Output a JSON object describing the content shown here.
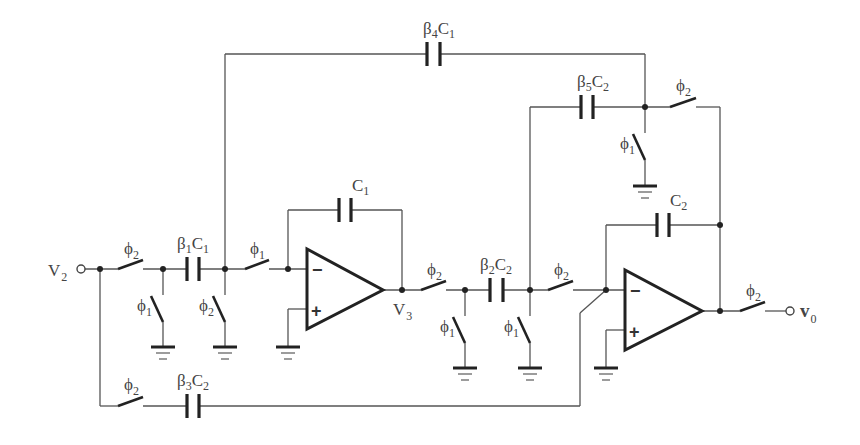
{
  "diagram": {
    "type": "switched-capacitor biquad circuit",
    "nodes": {
      "input": {
        "label": "V",
        "sub": "2"
      },
      "intermediate": {
        "label": "V",
        "sub": "3"
      },
      "output": {
        "label": "v",
        "sub": "0"
      }
    },
    "capacitors": {
      "b1c1": {
        "pre": "β",
        "psub": "1",
        "mid": "C",
        "csub": "1"
      },
      "b2c2": {
        "pre": "β",
        "psub": "2",
        "mid": "C",
        "csub": "2"
      },
      "b3c2": {
        "pre": "β",
        "psub": "3",
        "mid": "C",
        "csub": "2"
      },
      "b4c1": {
        "pre": "β",
        "psub": "4",
        "mid": "C",
        "csub": "1"
      },
      "b5c2": {
        "pre": "β",
        "psub": "5",
        "mid": "C",
        "csub": "2"
      },
      "c1": {
        "mid": "C",
        "csub": "1"
      },
      "c2": {
        "mid": "C",
        "csub": "2"
      }
    },
    "switches": {
      "s_in_series": {
        "phi": "ϕ",
        "sub": "2"
      },
      "s_in_shunt": {
        "phi": "ϕ",
        "sub": "1"
      },
      "s_b1_shunt": {
        "phi": "ϕ",
        "sub": "2"
      },
      "s_oa1_series": {
        "phi": "ϕ",
        "sub": "1"
      },
      "s_v3_series": {
        "phi": "ϕ",
        "sub": "2"
      },
      "s_b2l_shunt": {
        "phi": "ϕ",
        "sub": "1"
      },
      "s_b2r_shunt": {
        "phi": "ϕ",
        "sub": "1"
      },
      "s_b2_series": {
        "phi": "ϕ",
        "sub": "2"
      },
      "s_b5_shunt": {
        "phi": "ϕ",
        "sub": "1"
      },
      "s_b5_series": {
        "phi": "ϕ",
        "sub": "2"
      },
      "s_out_series": {
        "phi": "ϕ",
        "sub": "2"
      },
      "s_b3_series": {
        "phi": "ϕ",
        "sub": "2"
      }
    },
    "opamps": {
      "oa1": {
        "minus": "−",
        "plus": "+"
      },
      "oa2": {
        "minus": "−",
        "plus": "+"
      }
    }
  }
}
